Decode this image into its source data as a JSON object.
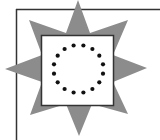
{
  "figure": {
    "colors": {
      "background": "#ffffff",
      "star": "#8c8c8c",
      "frame": "#333333",
      "square_fill": "#ffffff",
      "square_stroke": "#333333",
      "dots": "#111111"
    },
    "dot_count": 16
  }
}
